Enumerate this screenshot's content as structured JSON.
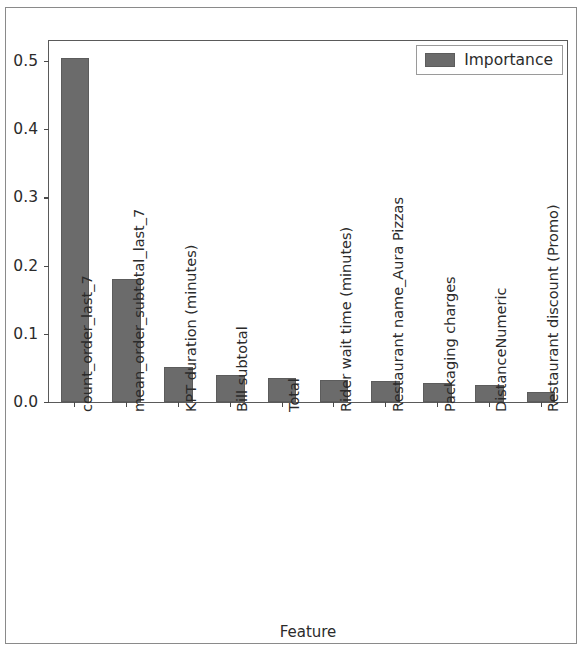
{
  "chart_data": {
    "type": "bar",
    "title": "",
    "xlabel": "Feature",
    "ylabel": "",
    "ylim": [
      0.0,
      0.5295
    ],
    "xlim": [
      -0.5,
      9.5
    ],
    "grid": false,
    "legend_position": "upper right",
    "bar_color": "#6b6b6b",
    "yticks": [
      "0.0",
      "0.1",
      "0.2",
      "0.3",
      "0.4",
      "0.5"
    ],
    "ytick_values": [
      0.0,
      0.1,
      0.2,
      0.3,
      0.4,
      0.5
    ],
    "categories": [
      "count_order_last_7",
      "mean_order_subtotal_last_7",
      "KPT duration (minutes)",
      "Bill subtotal",
      "Total",
      "Rider wait time (minutes)",
      "Restaurant name_Aura Pizzas",
      "Packaging charges",
      "DistanceNumeric",
      "Restaurant discount (Promo)"
    ],
    "series": [
      {
        "name": "Importance",
        "values": [
          0.505,
          0.181,
          0.051,
          0.039,
          0.035,
          0.033,
          0.031,
          0.028,
          0.025,
          0.015
        ]
      }
    ]
  },
  "legend": {
    "entries": [
      {
        "label": "Importance",
        "color": "#6b6b6b"
      }
    ]
  }
}
